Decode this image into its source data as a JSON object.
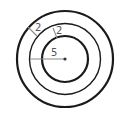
{
  "diagram": {
    "type": "concentric-circles",
    "labels": {
      "inner_radius": "5",
      "ring_width_outer": "2",
      "ring_width_inner": "2"
    },
    "colors": {
      "circle_stroke": "#1a1a1a",
      "measure_line": "#8a8a8a",
      "center_dot": "#333333",
      "label": "#555555"
    }
  }
}
